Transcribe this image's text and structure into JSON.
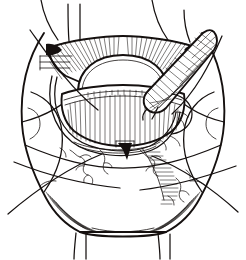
{
  "figure": {
    "medium": "pen-and-ink line drawing",
    "background_color": "#ffffff",
    "ink_color": "#15100f",
    "width": 246,
    "height": 260,
    "caption": ""
  },
  "palette": {
    "paper": "#ffffff",
    "ink": "#15100f",
    "ink_light": "#444040",
    "shadow_grey": "#6b6664"
  },
  "elements": [
    {
      "id": "outer-field",
      "name": "outer-tissue-field-outline",
      "description": "large hexagonal draped tissue field filling the frame"
    },
    {
      "id": "upper-flap",
      "name": "upper-retracted-flap",
      "description": "retracted upper tissue flap with radiating hatch lines"
    },
    {
      "id": "dome",
      "name": "central-dome-structure",
      "description": "pale rounded dome at centre of the exposure"
    },
    {
      "id": "striated-band",
      "name": "striated-muscle-band",
      "description": "horizontally striated band below the dome"
    },
    {
      "id": "retractor-loop",
      "name": "retractor-loop",
      "description": "thin curved retractor loop encircling the lower exposure"
    },
    {
      "id": "instrument",
      "name": "cross-hatched-instrument",
      "description": "cross-hatched elongated instrument entering from upper right"
    },
    {
      "id": "notch-marker",
      "name": "dark-notch-marker",
      "description": "small solid black triangular marker at base of dome"
    },
    {
      "id": "suture-top-left",
      "name": "suture-strand-top-left",
      "description": "suture strand exiting top left"
    },
    {
      "id": "suture-top-mid",
      "name": "suture-strand-top-middle",
      "description": "suture strand exiting top middle"
    },
    {
      "id": "suture-top-right",
      "name": "suture-strand-top-right",
      "description": "suture strand exiting top right"
    },
    {
      "id": "suture-bottom-left",
      "name": "suture-strand-bottom-left",
      "description": "suture strand hanging below bottom left"
    },
    {
      "id": "suture-bottom-right",
      "name": "suture-strand-bottom-right",
      "description": "suture strand hanging below bottom right"
    },
    {
      "id": "vessels-left",
      "name": "vessel-branches-left",
      "description": "wandering fine vessel branches, lower left"
    },
    {
      "id": "vessels-right",
      "name": "vessel-branches-right",
      "description": "wandering fine vessel branches, lower right"
    },
    {
      "id": "shadow-band",
      "name": "diagonal-shadow-hatching",
      "description": "diagonal hatched shadow band descending to lower right"
    },
    {
      "id": "corner-shading-left",
      "name": "corner-shading-bottom-left",
      "description": "dense converging hatch at bottom-left corner"
    },
    {
      "id": "corner-shading-right",
      "name": "corner-shading-bottom-right",
      "description": "dense converging hatch at bottom-right corner"
    }
  ]
}
